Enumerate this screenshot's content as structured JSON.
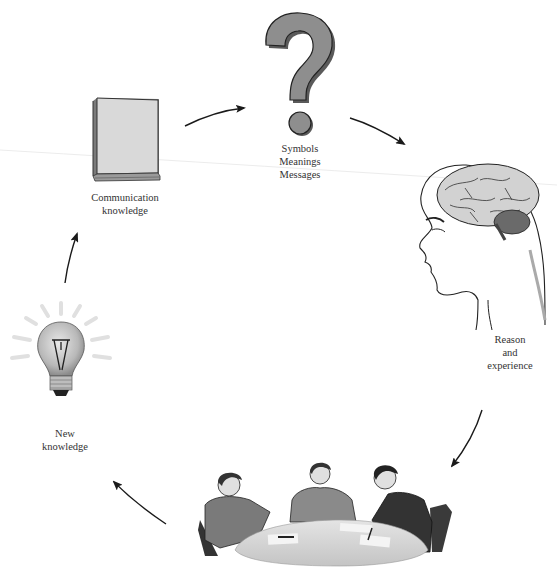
{
  "diagram": {
    "type": "cycle",
    "direction": "clockwise",
    "nodes": [
      {
        "id": "communication-knowledge",
        "icon": "book-icon",
        "label_lines": [
          "Communication",
          "knowledge"
        ]
      },
      {
        "id": "symbols",
        "icon": "question-mark-icon",
        "label_lines": [
          "Symbols",
          "Meanings",
          "Messages"
        ]
      },
      {
        "id": "reason",
        "icon": "head-brain-icon",
        "label_lines": [
          "Reason",
          "and",
          "experience"
        ]
      },
      {
        "id": "discussion",
        "icon": "meeting-table-icon",
        "label_lines": []
      },
      {
        "id": "new-knowledge",
        "icon": "light-bulb-icon",
        "label_lines": [
          "New",
          "knowledge"
        ]
      }
    ],
    "edges": [
      {
        "from": "communication-knowledge",
        "to": "symbols"
      },
      {
        "from": "symbols",
        "to": "reason"
      },
      {
        "from": "reason",
        "to": "discussion"
      },
      {
        "from": "discussion",
        "to": "new-knowledge"
      },
      {
        "from": "new-knowledge",
        "to": "communication-knowledge"
      }
    ]
  },
  "labels": {
    "communication": {
      "l1": "Communication",
      "l2": "knowledge"
    },
    "symbols": {
      "l1": "Symbols",
      "l2": "Meanings",
      "l3": "Messages"
    },
    "reason": {
      "l1": "Reason",
      "l2": "and",
      "l3": "experience"
    },
    "new_knowledge": {
      "l1": "New",
      "l2": "knowledge"
    }
  },
  "colors": {
    "background": "#ffffff",
    "question_mark": "#8c8c8c",
    "book": "#d8d8d8",
    "arrow": "#1a1a1a",
    "text": "#333333"
  }
}
